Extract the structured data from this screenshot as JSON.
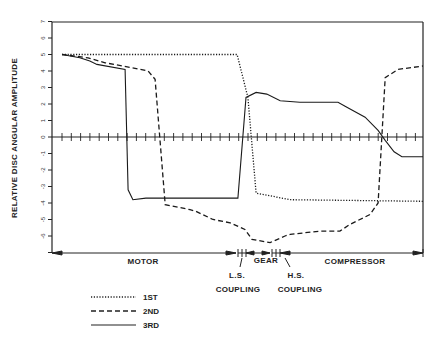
{
  "chart_data": {
    "type": "line",
    "title": "",
    "xlabel": "",
    "ylabel": "RELATIVE DISC ANGULAR AMPLITUDE",
    "ylim": [
      -7,
      7
    ],
    "yticks": [
      7,
      6,
      5,
      4,
      3,
      2,
      1,
      0,
      -1,
      -2,
      -3,
      -4,
      -5,
      -6,
      -7
    ],
    "ytick_labels": [
      "7",
      "6",
      "5",
      "4",
      "3",
      "2",
      "1",
      "0",
      "-1",
      "-2",
      "-3",
      "-4",
      "-5",
      "-6",
      ""
    ],
    "xlim": [
      0,
      100
    ],
    "x_axis_note": "Axial position along shaft train, normalized 0-100 (no numeric ticks shown)",
    "grid": false,
    "zero_line_ticks": true,
    "regions": [
      {
        "label": "MOTOR",
        "x_start": 0,
        "x_end": 50
      },
      {
        "label": "GEAR",
        "x_start": 54,
        "x_end": 62
      },
      {
        "label": "COMPRESSOR",
        "x_start": 66,
        "x_end": 100
      }
    ],
    "annotations": [
      {
        "text": [
          "L.S.",
          "COUPLING"
        ],
        "x": 51
      },
      {
        "text": [
          "H.S.",
          "COUPLING"
        ],
        "x": 63
      }
    ],
    "legend_position": "bottom-left",
    "series": [
      {
        "name": "1ST",
        "style": "dotted",
        "points": [
          [
            2.7,
            5
          ],
          [
            49.9,
            5
          ],
          [
            52.8,
            2.4
          ],
          [
            55,
            -3.4
          ],
          [
            64.2,
            -3.8
          ],
          [
            100,
            -3.9
          ]
        ]
      },
      {
        "name": "2ND",
        "style": "dashed",
        "points": [
          [
            2.7,
            5
          ],
          [
            9.7,
            4.8
          ],
          [
            14.3,
            4.5
          ],
          [
            19.1,
            4.3
          ],
          [
            25.9,
            4
          ],
          [
            27.8,
            3.5
          ],
          [
            30.5,
            -4.1
          ],
          [
            37.2,
            -4.4
          ],
          [
            38.8,
            -4.5
          ],
          [
            43.4,
            -5
          ],
          [
            48,
            -5.2
          ],
          [
            52,
            -5.6
          ],
          [
            53.9,
            -6.2
          ],
          [
            58.8,
            -6.4
          ],
          [
            62.8,
            -6
          ],
          [
            64.2,
            -5.9
          ],
          [
            72.2,
            -5.7
          ],
          [
            77.6,
            -5.7
          ],
          [
            80.3,
            -5.3
          ],
          [
            85.7,
            -4.7
          ],
          [
            87.9,
            -4
          ],
          [
            89.8,
            3.6
          ],
          [
            93.3,
            4.1
          ],
          [
            100,
            4.3
          ]
        ]
      },
      {
        "name": "3RD",
        "style": "solid",
        "points": [
          [
            2.7,
            5
          ],
          [
            7.5,
            4.8
          ],
          [
            10.2,
            4.6
          ],
          [
            12.1,
            4.4
          ],
          [
            19.7,
            4.1
          ],
          [
            20.5,
            -3.2
          ],
          [
            21.8,
            -3.8
          ],
          [
            25.3,
            -3.7
          ],
          [
            50.1,
            -3.7
          ],
          [
            52.3,
            2.4
          ],
          [
            55,
            2.7
          ],
          [
            57.9,
            2.6
          ],
          [
            61.5,
            2.2
          ],
          [
            66.8,
            2.1
          ],
          [
            77.1,
            2.1
          ],
          [
            79.5,
            1.8
          ],
          [
            84.4,
            1.2
          ],
          [
            87.9,
            0.4
          ],
          [
            89.8,
            -0.2
          ],
          [
            92.2,
            -0.9
          ],
          [
            94.3,
            -1.2
          ],
          [
            100,
            -1.2
          ]
        ]
      }
    ]
  },
  "axis": {
    "ylabel": "RELATIVE DISC ANGULAR AMPLITUDE",
    "ytick_labels": [
      "7",
      "6",
      "5",
      "4",
      "3",
      "2",
      "1",
      "0",
      "-1",
      "-2",
      "-3",
      "-4",
      "-5",
      "-6"
    ]
  },
  "regions": {
    "motor": "MOTOR",
    "gear": "GEAR",
    "compressor": "COMPRESSOR",
    "ls_top": "L.S.",
    "ls_bottom": "COUPLING",
    "hs_top": "H.S.",
    "hs_bottom": "COUPLING"
  },
  "legend": {
    "items": [
      {
        "label": "1ST",
        "style": "dotted"
      },
      {
        "label": "2ND",
        "style": "dashed"
      },
      {
        "label": "3RD",
        "style": "solid"
      }
    ]
  },
  "colors": {
    "ink": "#1a1a1a",
    "background": "#ffffff"
  }
}
